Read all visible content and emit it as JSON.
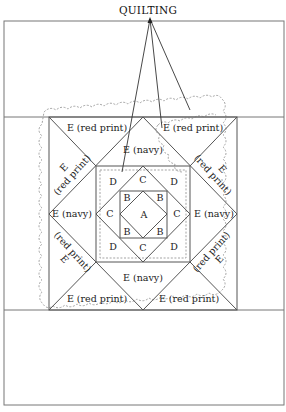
{
  "title": "QUILTING",
  "pieces": {
    "A": "A",
    "B": "B",
    "C": "C",
    "D": "D",
    "e_red_print": "E (red print)",
    "e_navy": "E (navy)",
    "e_letter": "E",
    "red_print": "(red print)"
  },
  "colors": {
    "line": "#555555",
    "frame": "#777777",
    "quilting": "#999999",
    "text": "#222222"
  }
}
